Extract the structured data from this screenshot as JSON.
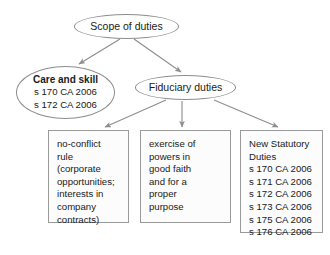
{
  "diagram": {
    "title": "Scope of duties",
    "nodes": {
      "scope": {
        "shape": "ellipse",
        "lines": [
          "Scope of duties"
        ]
      },
      "care_and_skill": {
        "shape": "ellipse",
        "lines": [
          "Care and skill",
          "s 170 CA 2006",
          "s 172 CA 2006"
        ]
      },
      "fiduciary_duties": {
        "shape": "ellipse",
        "lines": [
          "Fiduciary duties"
        ]
      },
      "no_conflict_rule": {
        "shape": "box",
        "lines": [
          "no-conflict",
          "rule",
          "(corporate",
          "opportunities;",
          "interests in",
          "company",
          "contracts)"
        ]
      },
      "good_faith_proper_purpose": {
        "shape": "box",
        "lines": [
          "exercise of",
          "powers in",
          "good faith",
          "and for a",
          "proper",
          "purpose"
        ]
      },
      "new_statutory_duties": {
        "shape": "box",
        "lines": [
          "New Statutory",
          "Duties",
          "s 170 CA 2006",
          "s 171 CA 2006",
          "s 172 CA 2006",
          "s 173 CA 2006",
          "s 175 CA 2006",
          "s 176 CA 2006"
        ]
      }
    },
    "edges": [
      {
        "from": "scope",
        "to": "care_and_skill",
        "arrow": true
      },
      {
        "from": "scope",
        "to": "fiduciary_duties",
        "arrow": true
      },
      {
        "from": "fiduciary_duties",
        "to": "no_conflict_rule",
        "arrow": true
      },
      {
        "from": "fiduciary_duties",
        "to": "good_faith_proper_purpose",
        "arrow": true
      },
      {
        "from": "fiduciary_duties",
        "to": "new_statutory_duties",
        "arrow": true
      }
    ],
    "colors": {
      "background": "#ffffff",
      "node_stroke": "#8d8d8d",
      "box_stroke": "#9a9a9a",
      "edge_stroke": "#8d8d8d",
      "text": "#1a1a1a"
    }
  }
}
